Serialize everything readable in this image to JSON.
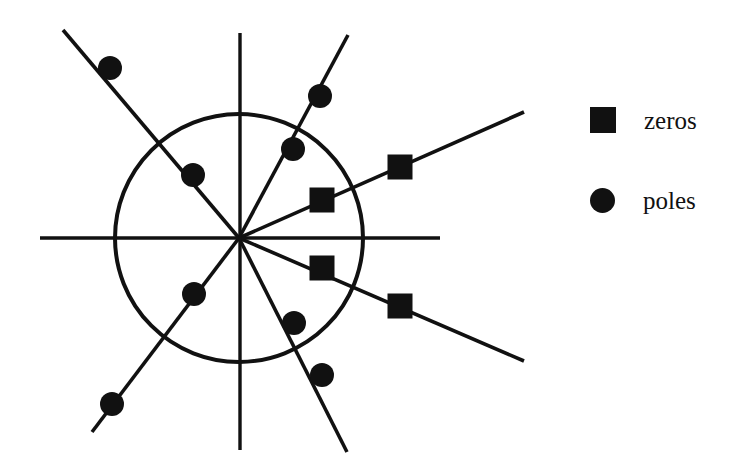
{
  "figure": {
    "kind": "pole-zero-plot",
    "background_color": "#ffffff",
    "ink_color": "#111111",
    "width": 732,
    "height": 464
  },
  "legend": {
    "position": "right",
    "entries": [
      {
        "marker": "square-marker-icon",
        "shape": "square",
        "label": "zeros"
      },
      {
        "marker": "circle-marker-icon",
        "shape": "circle",
        "label": "poles"
      }
    ]
  },
  "chart_data": {
    "type": "scatter",
    "title": "",
    "xlabel": "",
    "ylabel": "",
    "grid": false,
    "legend_position": "right",
    "axes": {
      "origin": {
        "x": 239,
        "y": 238
      },
      "real_axis": {
        "x1": 40,
        "y1": 238,
        "x2": 440,
        "y2": 238
      },
      "imag_axis": {
        "x1": 240,
        "y1": 33,
        "x2": 240,
        "y2": 450
      }
    },
    "unit_circle": {
      "cx": 239,
      "cy": 238,
      "r": 124,
      "stroke_width": 4
    },
    "rays": [
      {
        "name": "pole-ray-upper-left",
        "angle_deg": 127,
        "x1": 239,
        "y1": 238,
        "x2": 63,
        "y2": 30
      },
      {
        "name": "pole-ray-upper-right",
        "angle_deg": 63,
        "x1": 239,
        "y1": 238,
        "x2": 348,
        "y2": 35
      },
      {
        "name": "pole-ray-lower-left",
        "angle_deg": 232,
        "x1": 239,
        "y1": 238,
        "x2": 92,
        "y2": 432
      },
      {
        "name": "pole-ray-lower-right",
        "angle_deg": 297,
        "x1": 239,
        "y1": 238,
        "x2": 347,
        "y2": 452
      },
      {
        "name": "zero-ray-upper-right",
        "angle_deg": 22,
        "x1": 239,
        "y1": 238,
        "x2": 524,
        "y2": 112
      },
      {
        "name": "zero-ray-lower-right",
        "angle_deg": 338,
        "x1": 239,
        "y1": 238,
        "x2": 524,
        "y2": 361
      }
    ],
    "series": [
      {
        "name": "poles",
        "marker": "circle",
        "marker_size": 24,
        "points": [
          {
            "id": "pole-ul-inner",
            "x": 193,
            "y": 175
          },
          {
            "id": "pole-ul-outer",
            "x": 110,
            "y": 68
          },
          {
            "id": "pole-ur-inner",
            "x": 293,
            "y": 149
          },
          {
            "id": "pole-ur-outer",
            "x": 320,
            "y": 96
          },
          {
            "id": "pole-ll-inner",
            "x": 194,
            "y": 294
          },
          {
            "id": "pole-ll-outer",
            "x": 112,
            "y": 404
          },
          {
            "id": "pole-lr-inner",
            "x": 294,
            "y": 323
          },
          {
            "id": "pole-lr-outer",
            "x": 322,
            "y": 375
          }
        ]
      },
      {
        "name": "zeros",
        "marker": "square",
        "marker_size": 25,
        "points": [
          {
            "id": "zero-ur-inner",
            "x": 322,
            "y": 200
          },
          {
            "id": "zero-ur-outer",
            "x": 400,
            "y": 167
          },
          {
            "id": "zero-lr-inner",
            "x": 322,
            "y": 268
          },
          {
            "id": "zero-lr-outer",
            "x": 400,
            "y": 306
          }
        ]
      }
    ]
  }
}
